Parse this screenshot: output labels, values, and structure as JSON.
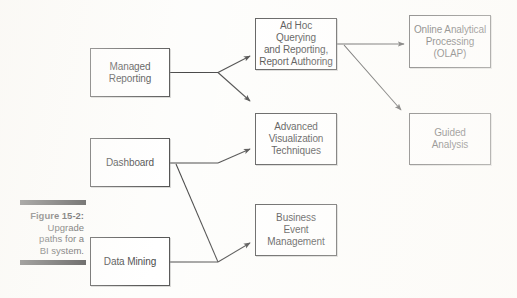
{
  "figure": {
    "caption_title": "Figure 15-2:",
    "caption_body": "Upgrade\npaths for a\nBI system.",
    "bar_color": "#0d0d0d"
  },
  "diagram": {
    "type": "flow-diagram",
    "box_border_color": "#2b2b2b",
    "box_fill_color": "#ffffff",
    "connector_color": "#1a1a1a",
    "nodes": [
      {
        "id": "managed-reporting",
        "label": "Managed\nReporting",
        "x": 90,
        "y": 48,
        "w": 80,
        "h": 49,
        "column": "left"
      },
      {
        "id": "dashboard",
        "label": "Dashboard",
        "x": 90,
        "y": 138,
        "w": 80,
        "h": 49,
        "column": "left"
      },
      {
        "id": "data-mining",
        "label": "Data Mining",
        "x": 90,
        "y": 237,
        "w": 80,
        "h": 49,
        "column": "left"
      },
      {
        "id": "ad-hoc-querying",
        "label": "Ad Hoc Querying\nand Reporting,\nReport Authoring",
        "x": 255,
        "y": 18,
        "w": 82,
        "h": 52,
        "column": "middle"
      },
      {
        "id": "advanced-visualization",
        "label": "Advanced\nVisualization\nTechniques",
        "x": 255,
        "y": 113,
        "w": 82,
        "h": 52,
        "column": "middle"
      },
      {
        "id": "business-event-management",
        "label": "Business\nEvent\nManagement",
        "x": 255,
        "y": 204,
        "w": 82,
        "h": 52,
        "column": "middle"
      },
      {
        "id": "olap",
        "label": "Online Analytical\nProcessing\n(OLAP)",
        "x": 409,
        "y": 15,
        "w": 82,
        "h": 53,
        "column": "right"
      },
      {
        "id": "guided-analysis",
        "label": "Guided\nAnalysis",
        "x": 409,
        "y": 113,
        "w": 82,
        "h": 52,
        "column": "right"
      }
    ],
    "edges": [
      {
        "id": "managed-to-adhoc",
        "from": "managed-reporting",
        "to": "ad-hoc-querying",
        "style": "elbow-fork-up"
      },
      {
        "id": "managed-to-advanced",
        "from": "managed-reporting",
        "to": "advanced-visualization",
        "style": "elbow-fork-down"
      },
      {
        "id": "adhoc-to-olap",
        "from": "ad-hoc-querying",
        "to": "olap",
        "style": "straight-horizontal"
      },
      {
        "id": "adhoc-to-guided",
        "from": "ad-hoc-querying",
        "to": "guided-analysis",
        "style": "diagonal-down"
      },
      {
        "id": "dashboard-to-advanced",
        "from": "dashboard",
        "to": "advanced-visualization",
        "style": "elbow-up"
      },
      {
        "id": "dashboard-to-business-event",
        "from": "dashboard",
        "to": "business-event-management",
        "style": "long-diagonal-down"
      },
      {
        "id": "data-mining-to-business-event",
        "from": "data-mining",
        "to": "business-event-management",
        "style": "elbow-up"
      }
    ]
  }
}
